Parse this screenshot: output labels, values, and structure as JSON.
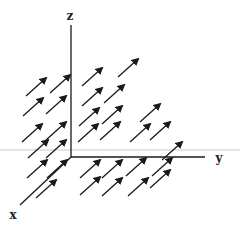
{
  "diagram": {
    "title": "",
    "colors": {
      "background": "#ffffff",
      "ink": "#1a1a1a",
      "scanline": "#e4e4e4"
    },
    "axes": {
      "origin": [
        71,
        157
      ],
      "z": {
        "label": "z",
        "end": [
          71,
          25
        ],
        "label_pos": [
          70,
          20
        ]
      },
      "y": {
        "label": "y",
        "end": [
          205,
          157
        ],
        "label_pos": [
          219,
          162
        ]
      },
      "x": {
        "label": "x",
        "end": [
          20,
          205
        ],
        "label_pos": [
          13,
          219
        ]
      }
    },
    "arrow": {
      "dx": 20,
      "dy": -18,
      "direction": "up-right"
    },
    "arrows": [
      [
        26,
        96
      ],
      [
        50,
        93
      ],
      [
        82,
        86
      ],
      [
        118,
        77
      ],
      [
        23,
        116
      ],
      [
        46,
        114
      ],
      [
        82,
        106
      ],
      [
        104,
        103
      ],
      [
        79,
        126
      ],
      [
        102,
        124
      ],
      [
        140,
        122
      ],
      [
        22,
        142
      ],
      [
        46,
        140
      ],
      [
        78,
        142
      ],
      [
        100,
        140
      ],
      [
        130,
        142
      ],
      [
        150,
        140
      ],
      [
        28,
        158
      ],
      [
        46,
        158
      ],
      [
        162,
        160
      ],
      [
        27,
        178
      ],
      [
        47,
        178
      ],
      [
        80,
        178
      ],
      [
        102,
        178
      ],
      [
        126,
        176
      ],
      [
        152,
        176
      ],
      [
        36,
        198
      ],
      [
        80,
        195
      ],
      [
        102,
        196
      ],
      [
        128,
        196
      ],
      [
        150,
        188
      ]
    ]
  }
}
